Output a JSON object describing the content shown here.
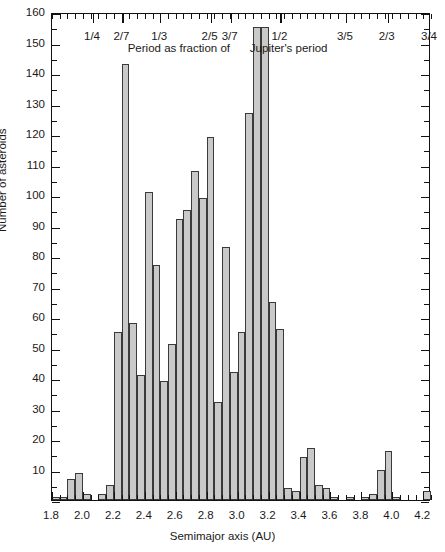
{
  "chart_data": {
    "type": "bar",
    "title": "",
    "subtitle": "",
    "xlabel": "Semimajor axis (AU)",
    "ylabel": "Number of asteroids",
    "xlim": [
      1.8,
      4.25
    ],
    "ylim": [
      0,
      160
    ],
    "bin_width": 0.05,
    "grid": false,
    "legend": null,
    "annotations": [
      {
        "text": "Period as fraction of",
        "x": 2.62,
        "y": 149
      },
      {
        "text": "Jupiter's period",
        "x": 3.33,
        "y": 149
      }
    ],
    "secondary_axis": {
      "position": "top",
      "label": "Period as fraction of Jupiter's period",
      "ticks": [
        {
          "label": "1/4",
          "x": 2.065
        },
        {
          "label": "2/7",
          "x": 2.255
        },
        {
          "label": "1/3",
          "x": 2.5
        },
        {
          "label": "2/5",
          "x": 2.825
        },
        {
          "label": "3/7",
          "x": 2.955
        },
        {
          "label": "1/2",
          "x": 3.277
        },
        {
          "label": "3/5",
          "x": 3.7
        },
        {
          "label": "2/3",
          "x": 3.97
        },
        {
          "label": "3/4",
          "x": 4.295
        }
      ]
    },
    "xticks": [
      "1.8",
      "2.0",
      "2.2",
      "2.4",
      "2.6",
      "2.8",
      "3.0",
      "3.2",
      "3.4",
      "3.6",
      "3.8",
      "4.0",
      "4.2"
    ],
    "xtick_values": [
      1.8,
      2.0,
      2.2,
      2.4,
      2.6,
      2.8,
      3.0,
      3.2,
      3.4,
      3.6,
      3.8,
      4.0,
      4.2
    ],
    "yticks": [
      "10",
      "20",
      "30",
      "40",
      "50",
      "60",
      "70",
      "80",
      "90",
      "100",
      "110",
      "120",
      "130",
      "140",
      "150",
      "160"
    ],
    "ytick_values": [
      10,
      20,
      30,
      40,
      50,
      60,
      70,
      80,
      90,
      100,
      110,
      120,
      130,
      140,
      150,
      160
    ],
    "bins": [
      {
        "x0": 1.8,
        "x1": 1.85,
        "value": 1
      },
      {
        "x0": 1.85,
        "x1": 1.9,
        "value": 1
      },
      {
        "x0": 1.9,
        "x1": 1.95,
        "value": 7
      },
      {
        "x0": 1.95,
        "x1": 2.0,
        "value": 9
      },
      {
        "x0": 2.0,
        "x1": 2.05,
        "value": 2
      },
      {
        "x0": 2.05,
        "x1": 2.1,
        "value": 0
      },
      {
        "x0": 2.1,
        "x1": 2.15,
        "value": 2
      },
      {
        "x0": 2.15,
        "x1": 2.2,
        "value": 5
      },
      {
        "x0": 2.2,
        "x1": 2.25,
        "value": 55
      },
      {
        "x0": 2.25,
        "x1": 2.3,
        "value": 143
      },
      {
        "x0": 2.3,
        "x1": 2.35,
        "value": 58
      },
      {
        "x0": 2.35,
        "x1": 2.4,
        "value": 41
      },
      {
        "x0": 2.4,
        "x1": 2.45,
        "value": 101
      },
      {
        "x0": 2.45,
        "x1": 2.5,
        "value": 77
      },
      {
        "x0": 2.5,
        "x1": 2.55,
        "value": 39
      },
      {
        "x0": 2.55,
        "x1": 2.6,
        "value": 51
      },
      {
        "x0": 2.6,
        "x1": 2.65,
        "value": 92
      },
      {
        "x0": 2.65,
        "x1": 2.7,
        "value": 95
      },
      {
        "x0": 2.7,
        "x1": 2.75,
        "value": 108
      },
      {
        "x0": 2.75,
        "x1": 2.8,
        "value": 99
      },
      {
        "x0": 2.8,
        "x1": 2.85,
        "value": 119
      },
      {
        "x0": 2.85,
        "x1": 2.9,
        "value": 32
      },
      {
        "x0": 2.9,
        "x1": 2.95,
        "value": 83
      },
      {
        "x0": 2.95,
        "x1": 3.0,
        "value": 42
      },
      {
        "x0": 3.0,
        "x1": 3.05,
        "value": 55
      },
      {
        "x0": 3.05,
        "x1": 3.1,
        "value": 127
      },
      {
        "x0": 3.1,
        "x1": 3.15,
        "value": 155
      },
      {
        "x0": 3.15,
        "x1": 3.2,
        "value": 155
      },
      {
        "x0": 3.2,
        "x1": 3.25,
        "value": 65
      },
      {
        "x0": 3.25,
        "x1": 3.3,
        "value": 56
      },
      {
        "x0": 3.3,
        "x1": 3.35,
        "value": 4
      },
      {
        "x0": 3.35,
        "x1": 3.4,
        "value": 3
      },
      {
        "x0": 3.4,
        "x1": 3.45,
        "value": 14
      },
      {
        "x0": 3.45,
        "x1": 3.5,
        "value": 17
      },
      {
        "x0": 3.5,
        "x1": 3.55,
        "value": 5
      },
      {
        "x0": 3.55,
        "x1": 3.6,
        "value": 4
      },
      {
        "x0": 3.6,
        "x1": 3.65,
        "value": 1
      },
      {
        "x0": 3.65,
        "x1": 3.7,
        "value": 0
      },
      {
        "x0": 3.7,
        "x1": 3.75,
        "value": 1
      },
      {
        "x0": 3.75,
        "x1": 3.8,
        "value": 0
      },
      {
        "x0": 3.8,
        "x1": 3.85,
        "value": 1
      },
      {
        "x0": 3.85,
        "x1": 3.9,
        "value": 2
      },
      {
        "x0": 3.9,
        "x1": 3.95,
        "value": 10
      },
      {
        "x0": 3.95,
        "x1": 4.0,
        "value": 16
      },
      {
        "x0": 4.0,
        "x1": 4.05,
        "value": 1
      },
      {
        "x0": 4.05,
        "x1": 4.1,
        "value": 0
      },
      {
        "x0": 4.1,
        "x1": 4.15,
        "value": 0
      },
      {
        "x0": 4.15,
        "x1": 4.2,
        "value": 0
      },
      {
        "x0": 4.2,
        "x1": 4.25,
        "value": 3
      }
    ]
  },
  "axes": {
    "y_title": "Number of asteroids",
    "x_title": "Semimajor axis (AU)"
  },
  "top_axis": {
    "note_left": "Period as fraction of",
    "note_right": "Jupiter's period"
  }
}
